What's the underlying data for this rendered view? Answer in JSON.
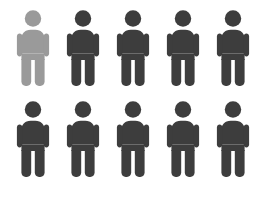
{
  "chart_data": {
    "type": "pictogram",
    "title": "",
    "subtitle": "",
    "xlabel": "",
    "ylabel": "",
    "icon": "person-icon",
    "rows": 2,
    "columns": 5,
    "total_icons": 10,
    "highlighted_count": 1,
    "unhighlighted_count": 9,
    "ratio_text": "1 in 10",
    "legend": [],
    "annotations": [],
    "grid": false,
    "colors": {
      "highlight": "#9a9a9a",
      "base": "#3d3d3d",
      "background": "#ffffff"
    },
    "categories": [
      "highlighted",
      "remaining"
    ],
    "values": [
      1,
      9
    ],
    "icons": [
      {
        "index": 1,
        "row": 1,
        "column": 1,
        "state": "highlighted",
        "color": "#9a9a9a"
      },
      {
        "index": 2,
        "row": 1,
        "column": 2,
        "state": "base",
        "color": "#3d3d3d"
      },
      {
        "index": 3,
        "row": 1,
        "column": 3,
        "state": "base",
        "color": "#3d3d3d"
      },
      {
        "index": 4,
        "row": 1,
        "column": 4,
        "state": "base",
        "color": "#3d3d3d"
      },
      {
        "index": 5,
        "row": 1,
        "column": 5,
        "state": "base",
        "color": "#3d3d3d"
      },
      {
        "index": 6,
        "row": 2,
        "column": 1,
        "state": "base",
        "color": "#3d3d3d"
      },
      {
        "index": 7,
        "row": 2,
        "column": 2,
        "state": "base",
        "color": "#3d3d3d"
      },
      {
        "index": 8,
        "row": 2,
        "column": 3,
        "state": "base",
        "color": "#3d3d3d"
      },
      {
        "index": 9,
        "row": 2,
        "column": 4,
        "state": "base",
        "color": "#3d3d3d"
      },
      {
        "index": 10,
        "row": 2,
        "column": 5,
        "state": "base",
        "color": "#3d3d3d"
      }
    ]
  }
}
